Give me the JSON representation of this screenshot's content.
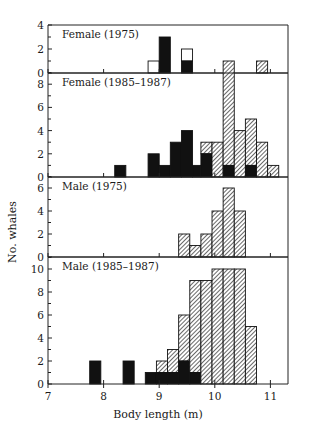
{
  "chart_data": {
    "type": "bar",
    "subtype": "stacked-histogram-panels",
    "xlabel": "Body length (m)",
    "ylabel": "No. whales",
    "xlim": [
      7,
      11.4
    ],
    "xticks": [
      7,
      8,
      9,
      10,
      11
    ],
    "bin_width": 0.2,
    "legend": [],
    "fills": {
      "black": "#111111",
      "hatched": "#888888",
      "open": "#ffffff"
    },
    "panels": [
      {
        "title": "Female (1975)",
        "ylim": [
          0,
          4
        ],
        "yticks": [
          0,
          2,
          4
        ],
        "bars": [
          {
            "x0": 8.8,
            "x1": 9.0,
            "total": 1,
            "black": 0,
            "fill": "open"
          },
          {
            "x0": 9.0,
            "x1": 9.2,
            "total": 3,
            "black": 3,
            "fill": "open"
          },
          {
            "x0": 9.4,
            "x1": 9.6,
            "total": 2,
            "black": 1,
            "fill": "open"
          },
          {
            "x0": 10.75,
            "x1": 10.95,
            "total": 1,
            "black": 0,
            "fill": "hatched"
          }
        ]
      },
      {
        "title": "Female (1985–1987)",
        "ylim": [
          0,
          9
        ],
        "yticks": [
          0,
          2,
          4,
          6,
          8
        ],
        "bars": [
          {
            "x0": 8.2,
            "x1": 8.4,
            "total": 1,
            "black": 1,
            "fill": "hatched"
          },
          {
            "x0": 8.8,
            "x1": 9.0,
            "total": 2,
            "black": 2,
            "fill": "hatched"
          },
          {
            "x0": 9.0,
            "x1": 9.2,
            "total": 1,
            "black": 1,
            "fill": "hatched"
          },
          {
            "x0": 9.2,
            "x1": 9.4,
            "total": 3,
            "black": 3,
            "fill": "hatched"
          },
          {
            "x0": 9.4,
            "x1": 9.6,
            "total": 4,
            "black": 4,
            "fill": "hatched"
          },
          {
            "x0": 9.6,
            "x1": 9.75,
            "total": 1,
            "black": 1,
            "fill": "hatched"
          },
          {
            "x0": 9.75,
            "x1": 9.95,
            "total": 3,
            "black": 2,
            "fill": "hatched"
          },
          {
            "x0": 9.95,
            "x1": 10.15,
            "total": 3,
            "black": 0,
            "fill": "hatched"
          },
          {
            "x0": 10.15,
            "x1": 10.35,
            "total": 10,
            "black": 1,
            "fill": "hatched"
          },
          {
            "x0": 10.35,
            "x1": 10.55,
            "total": 4,
            "black": 0,
            "fill": "hatched"
          },
          {
            "x0": 10.55,
            "x1": 10.75,
            "total": 5,
            "black": 1,
            "fill": "hatched"
          },
          {
            "x0": 10.75,
            "x1": 10.95,
            "total": 3,
            "black": 0,
            "fill": "hatched"
          },
          {
            "x0": 10.95,
            "x1": 11.15,
            "total": 1,
            "black": 0,
            "fill": "hatched"
          }
        ]
      },
      {
        "title": "Male (1975)",
        "ylim": [
          0,
          7
        ],
        "yticks": [
          0,
          2,
          4,
          6
        ],
        "bars": [
          {
            "x0": 9.35,
            "x1": 9.55,
            "total": 2,
            "black": 0,
            "fill": "hatched"
          },
          {
            "x0": 9.55,
            "x1": 9.75,
            "total": 1,
            "black": 0,
            "fill": "hatched"
          },
          {
            "x0": 9.75,
            "x1": 9.95,
            "total": 2,
            "black": 0,
            "fill": "hatched"
          },
          {
            "x0": 9.95,
            "x1": 10.15,
            "total": 4,
            "black": 0,
            "fill": "hatched"
          },
          {
            "x0": 10.15,
            "x1": 10.35,
            "total": 6,
            "black": 0,
            "fill": "hatched"
          },
          {
            "x0": 10.35,
            "x1": 10.55,
            "total": 4,
            "black": 0,
            "fill": "hatched"
          }
        ]
      },
      {
        "title": "Male (1985–1987)",
        "ylim": [
          0,
          11
        ],
        "yticks": [
          0,
          2,
          4,
          6,
          8,
          10
        ],
        "bars": [
          {
            "x0": 7.75,
            "x1": 7.95,
            "total": 2,
            "black": 2,
            "fill": "hatched"
          },
          {
            "x0": 8.35,
            "x1": 8.55,
            "total": 2,
            "black": 2,
            "fill": "hatched"
          },
          {
            "x0": 8.75,
            "x1": 8.95,
            "total": 1,
            "black": 1,
            "fill": "hatched"
          },
          {
            "x0": 8.95,
            "x1": 9.15,
            "total": 2,
            "black": 1,
            "fill": "hatched"
          },
          {
            "x0": 9.15,
            "x1": 9.35,
            "total": 3,
            "black": 1,
            "fill": "hatched"
          },
          {
            "x0": 9.35,
            "x1": 9.55,
            "total": 6,
            "black": 2,
            "fill": "hatched"
          },
          {
            "x0": 9.55,
            "x1": 9.75,
            "total": 9,
            "black": 1,
            "fill": "hatched"
          },
          {
            "x0": 9.75,
            "x1": 9.95,
            "total": 9,
            "black": 0,
            "fill": "hatched"
          },
          {
            "x0": 9.95,
            "x1": 10.15,
            "total": 10,
            "black": 0,
            "fill": "hatched"
          },
          {
            "x0": 10.15,
            "x1": 10.35,
            "total": 10,
            "black": 0,
            "fill": "hatched"
          },
          {
            "x0": 10.35,
            "x1": 10.55,
            "total": 10,
            "black": 0,
            "fill": "hatched"
          },
          {
            "x0": 10.55,
            "x1": 10.75,
            "total": 5,
            "black": 0,
            "fill": "hatched"
          }
        ]
      }
    ]
  },
  "axes": {
    "xlabel": "Body length (m)",
    "ylabel": "No. whales",
    "xtick_labels": [
      "7",
      "8",
      "9",
      "10",
      "11"
    ]
  }
}
